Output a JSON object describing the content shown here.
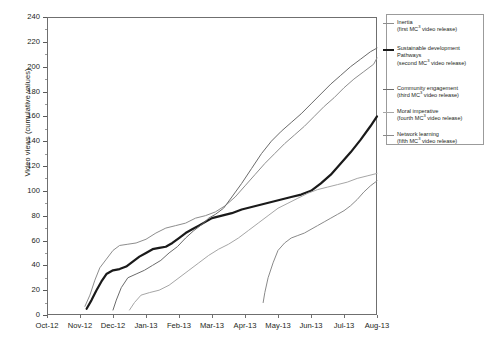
{
  "chart_data": {
    "type": "line",
    "title": "",
    "xlabel": "",
    "ylabel": "Video views (cumulative values)",
    "ylim": [
      0,
      240
    ],
    "ytick_step": 20,
    "grid": false,
    "legend_position": "right",
    "categories": [
      "Oct-12",
      "Nov-12",
      "Dec-12",
      "Jan-13",
      "Feb-13",
      "Mar-13",
      "Apr-13",
      "May-13",
      "Jun-13",
      "Jul-13",
      "Aug-13"
    ],
    "yticks": [
      0,
      20,
      40,
      60,
      80,
      100,
      120,
      140,
      160,
      180,
      200,
      220,
      240
    ],
    "series": [
      {
        "name": "Inertia",
        "sublabel": "(first MC³ video release)",
        "release_order": "first",
        "color": "#8d8d8d",
        "width": 1.0,
        "x": [
          1.15,
          1.3,
          1.45,
          1.6,
          1.8,
          2.0,
          2.2,
          2.45,
          2.7,
          3.0,
          3.3,
          3.6,
          3.9,
          4.2,
          4.5,
          4.8,
          5.1,
          5.4,
          5.7,
          6.0,
          6.3,
          6.6,
          6.9,
          7.2,
          7.5,
          7.8,
          8.1,
          8.4,
          8.7,
          9.0,
          9.3,
          9.6,
          9.9,
          10.0
        ],
        "y": [
          7,
          16,
          28,
          38,
          45,
          52,
          56,
          57,
          58,
          61,
          66,
          70,
          72,
          74,
          78,
          80,
          83,
          88,
          95,
          104,
          113,
          122,
          130,
          138,
          145,
          152,
          160,
          168,
          175,
          183,
          190,
          196,
          202,
          207
        ]
      },
      {
        "name": "Sustainable development Pathways",
        "sublabel": "(second MC³ video release)",
        "release_order": "second",
        "color": "#1a1a1a",
        "width": 2.2,
        "x": [
          1.2,
          1.35,
          1.5,
          1.65,
          1.8,
          2.0,
          2.2,
          2.4,
          2.6,
          2.8,
          3.0,
          3.2,
          3.4,
          3.6,
          3.8,
          4.0,
          4.2,
          4.4,
          4.6,
          4.8,
          5.0,
          5.3,
          5.6,
          5.9,
          6.2,
          6.5,
          6.8,
          7.1,
          7.4,
          7.7,
          8.0,
          8.3,
          8.6,
          8.9,
          9.2,
          9.5,
          9.8,
          10.0
        ],
        "y": [
          5,
          12,
          20,
          27,
          33,
          36,
          37,
          39,
          43,
          47,
          50,
          53,
          54,
          55,
          58,
          62,
          66,
          69,
          72,
          75,
          78,
          80,
          82,
          85,
          87,
          89,
          91,
          93,
          95,
          97,
          100,
          106,
          113,
          122,
          131,
          141,
          152,
          160
        ]
      },
      {
        "name": "Community engagement",
        "sublabel": "(third MC³ video release)",
        "release_order": "third",
        "color": "#6b6b6b",
        "width": 1.0,
        "x": [
          2.0,
          2.1,
          2.25,
          2.45,
          2.7,
          2.95,
          3.2,
          3.45,
          3.7,
          3.95,
          4.2,
          4.45,
          4.7,
          4.9,
          5.1,
          5.35,
          5.6,
          5.9,
          6.2,
          6.5,
          6.8,
          7.1,
          7.4,
          7.7,
          8.0,
          8.3,
          8.6,
          8.9,
          9.2,
          9.5,
          9.8,
          10.0
        ],
        "y": [
          4,
          12,
          22,
          30,
          33,
          36,
          40,
          44,
          50,
          55,
          62,
          68,
          73,
          78,
          81,
          86,
          95,
          106,
          118,
          130,
          140,
          148,
          155,
          162,
          170,
          178,
          186,
          193,
          200,
          206,
          212,
          215
        ]
      },
      {
        "name": "Moral imperative",
        "sublabel": "(fourth MC³ video release)",
        "release_order": "fourth",
        "color": "#a6a6a6",
        "width": 1.0,
        "x": [
          2.5,
          2.65,
          2.85,
          3.1,
          3.4,
          3.7,
          4.0,
          4.3,
          4.6,
          4.9,
          5.2,
          5.5,
          5.8,
          6.1,
          6.4,
          6.7,
          7.0,
          7.3,
          7.6,
          7.9,
          8.2,
          8.5,
          8.8,
          9.1,
          9.4,
          9.7,
          10.0
        ],
        "y": [
          4,
          10,
          16,
          18,
          20,
          24,
          30,
          36,
          42,
          48,
          53,
          57,
          62,
          68,
          74,
          80,
          86,
          90,
          94,
          98,
          101,
          103,
          105,
          107,
          110,
          112,
          114
        ]
      },
      {
        "name": "Network learning",
        "sublabel": "(fifth MC³ video release)",
        "release_order": "fifth",
        "color": "#8a8a8a",
        "width": 1.0,
        "x": [
          6.55,
          6.6,
          6.7,
          6.85,
          7.0,
          7.2,
          7.4,
          7.6,
          7.8,
          8.0,
          8.2,
          8.4,
          8.6,
          8.8,
          9.0,
          9.2,
          9.4,
          9.6,
          9.8,
          10.0
        ],
        "y": [
          10,
          18,
          30,
          42,
          52,
          58,
          62,
          64,
          66,
          69,
          72,
          75,
          78,
          81,
          84,
          88,
          93,
          99,
          104,
          108
        ]
      }
    ]
  },
  "legend": {
    "items": [
      {
        "name": "Inertia",
        "sublabel": "(first MC3 video release)"
      },
      {
        "name": "Sustainable development Pathways",
        "sublabel": "(second MC3 video release)"
      },
      {
        "name": "Community engagement",
        "sublabel": "(third MC3 video release)"
      },
      {
        "name": "Moral imperative",
        "sublabel": "(fourth MC3 video release)"
      },
      {
        "name": "Network learning",
        "sublabel": "(fifth MC3 video release)"
      }
    ]
  }
}
